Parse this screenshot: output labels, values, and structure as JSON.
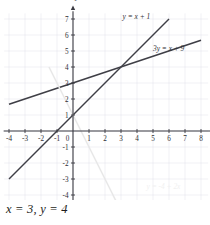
{
  "chart_data": {
    "type": "line",
    "title": "",
    "xlabel": "x",
    "ylabel": "y",
    "xlim": [
      -4,
      8
    ],
    "ylim": [
      -5,
      7
    ],
    "grid": true,
    "legend": "inline-labels",
    "x_ticks": [
      "-4",
      "-3",
      "-2",
      "-1",
      "0",
      "1",
      "2",
      "3",
      "4",
      "5",
      "6",
      "7",
      "8"
    ],
    "x_tick_values": [
      -4,
      -3,
      -2,
      -1,
      0,
      1,
      2,
      3,
      4,
      5,
      6,
      7,
      8
    ],
    "y_ticks": [
      "7",
      "6",
      "5",
      "4",
      "3",
      "2",
      "1",
      "-1",
      "-2",
      "-3",
      "-4",
      "-5"
    ],
    "y_tick_values": [
      7,
      6,
      5,
      4,
      3,
      2,
      1,
      -1,
      -2,
      -3,
      -4,
      -5
    ],
    "series": [
      {
        "name": "y = x + 1",
        "label": "y = x + 1",
        "color": "#3f3f46",
        "width": 1.5,
        "slope": 1,
        "intercept": 1,
        "x_from": -4,
        "x_to": 6,
        "label_x": 3.1,
        "label_y": 7.0
      },
      {
        "name": "3y = x + 9",
        "label": "3y = x + 9",
        "color": "#3f3f46",
        "width": 1.5,
        "slope": 0.3333333333,
        "intercept": 3,
        "x_from": -4,
        "x_to": 8,
        "label_x": 5.0,
        "label_y": 5.0
      },
      {
        "name": "faint-descending-line",
        "label": "",
        "color": "#e8e8e8",
        "width": 1.5,
        "slope": -2,
        "intercept": 1,
        "x_from": -1.5,
        "x_to": 3.0,
        "label_x": 0,
        "label_y": 0
      }
    ],
    "intersection": {
      "x": 3,
      "y": 4
    },
    "annotations": [
      {
        "name": "ghost-label",
        "text": "y = -4 + 2x",
        "x": 4.6,
        "y": -3.6
      }
    ]
  },
  "answer": {
    "text": "x = 3, y = 4",
    "x_value": "x = 3",
    "y_value": "y = 4"
  },
  "colors": {
    "axis": "#3b3b42",
    "grid": "#e2e2ea",
    "line": "#3f3f46",
    "faint_line": "#e8e8e8",
    "text": "#231f20",
    "background": "#ffffff"
  }
}
